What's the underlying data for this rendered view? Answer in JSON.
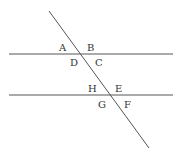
{
  "diagram": {
    "lines": {
      "parallel_top": {
        "x1": 9,
        "y1": 54,
        "x2": 173,
        "y2": 54
      },
      "parallel_bottom": {
        "x1": 9,
        "y1": 95,
        "x2": 173,
        "y2": 95
      },
      "transversal": {
        "x1": 49,
        "y1": 11,
        "x2": 149,
        "y2": 148
      }
    },
    "labels": [
      {
        "text": "A",
        "x": 59,
        "y": 51
      },
      {
        "text": "B",
        "x": 87,
        "y": 51
      },
      {
        "text": "D",
        "x": 70,
        "y": 66
      },
      {
        "text": "C",
        "x": 95,
        "y": 66
      },
      {
        "text": "H",
        "x": 88,
        "y": 92
      },
      {
        "text": "E",
        "x": 115,
        "y": 92
      },
      {
        "text": "G",
        "x": 98,
        "y": 108
      },
      {
        "text": "F",
        "x": 124,
        "y": 108
      }
    ],
    "stroke_color": "#555555"
  }
}
